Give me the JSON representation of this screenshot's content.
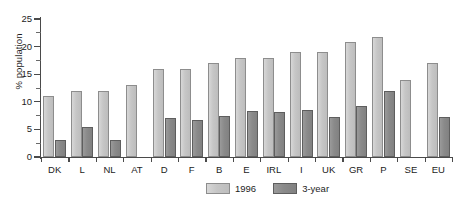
{
  "chart_data": {
    "type": "bar",
    "title": "",
    "xlabel": "",
    "ylabel": "% population",
    "ylim": [
      0,
      25
    ],
    "ytick_values": [
      0,
      5,
      10,
      15,
      20,
      25
    ],
    "ytick_labels": [
      "0",
      "5",
      "10",
      "15",
      "20",
      "25"
    ],
    "yminor_step": 2.5,
    "grid": false,
    "legend_position": "bottom-center",
    "categories": [
      "DK",
      "L",
      "NL",
      "AT",
      "D",
      "F",
      "B",
      "E",
      "IRL",
      "I",
      "UK",
      "GR",
      "P",
      "SE",
      "EU"
    ],
    "series": [
      {
        "name": "1996",
        "color": "#c6c6c6",
        "values": [
          11,
          12,
          12,
          13,
          16,
          16,
          17,
          18,
          18,
          19,
          19,
          20.8,
          21.8,
          14,
          17
        ]
      },
      {
        "name": "3-year",
        "color": "#8a8a8a",
        "values": [
          3.1,
          5.5,
          3.0,
          0,
          7.0,
          6.7,
          7.4,
          8.4,
          8.2,
          8.5,
          7.2,
          9.2,
          12.0,
          0,
          7.3
        ]
      }
    ]
  },
  "legend": {
    "entries": [
      {
        "label": "1996"
      },
      {
        "label": "3-year"
      }
    ]
  }
}
